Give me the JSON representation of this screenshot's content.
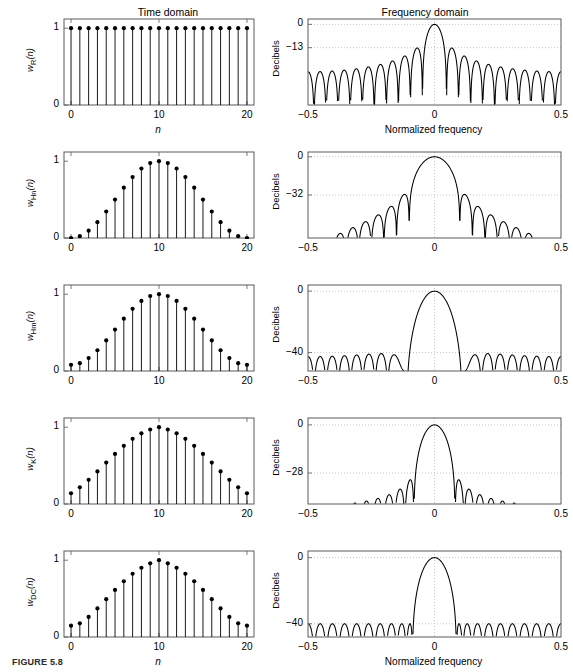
{
  "figure": {
    "caption": "FIGURE 5.8",
    "column_titles": {
      "time": "Time domain",
      "frequency": "Frequency domain"
    },
    "axis_labels": {
      "time_x": "n",
      "freq_x": "Normalized frequency",
      "freq_y": "Decibels"
    }
  },
  "chart_data": [
    {
      "type": "line",
      "panel": "time",
      "row": 1,
      "title": "Time domain",
      "window": "rectangular",
      "ylabel_main": "w",
      "ylabel_sub": "R",
      "ylabel_arg": "(n)",
      "xlabel": "n",
      "x": [
        0,
        1,
        2,
        3,
        4,
        5,
        6,
        7,
        8,
        9,
        10,
        11,
        12,
        13,
        14,
        15,
        16,
        17,
        18,
        19,
        20
      ],
      "values": [
        1,
        1,
        1,
        1,
        1,
        1,
        1,
        1,
        1,
        1,
        1,
        1,
        1,
        1,
        1,
        1,
        1,
        1,
        1,
        1,
        1
      ],
      "xlim": [
        -0.8,
        20.8
      ],
      "ylim": [
        0,
        1.12
      ],
      "xticks": [
        0,
        10,
        20
      ],
      "xticklabels": [
        "0",
        "10",
        "20"
      ],
      "yticks": [
        0,
        1
      ],
      "yticklabels": [
        "0",
        "1"
      ],
      "grid": false,
      "marker": "filled-circle",
      "stem": true
    },
    {
      "type": "line",
      "panel": "frequency",
      "row": 1,
      "title": "Frequency domain",
      "window": "rectangular",
      "ylabel": "Decibels",
      "xlabel": "Normalized frequency",
      "xlim": [
        -0.5,
        0.5
      ],
      "ylim": [
        -45,
        3
      ],
      "xticks": [
        -0.5,
        0,
        0.5
      ],
      "xticklabels": [
        "−0.5",
        "0",
        "0.5"
      ],
      "yticks": [
        0,
        -13
      ],
      "yticklabels": [
        "0",
        "−13"
      ],
      "peak_db": 0,
      "first_sidelobe_db": -13,
      "grid": true,
      "gridstyle": "dotted"
    },
    {
      "type": "line",
      "panel": "time",
      "row": 2,
      "window": "hanning",
      "ylabel_main": "w",
      "ylabel_sub": "Hn",
      "ylabel_arg": "(n)",
      "x": [
        0,
        1,
        2,
        3,
        4,
        5,
        6,
        7,
        8,
        9,
        10,
        11,
        12,
        13,
        14,
        15,
        16,
        17,
        18,
        19,
        20
      ],
      "values": [
        0,
        0.024,
        0.095,
        0.206,
        0.345,
        0.5,
        0.655,
        0.794,
        0.905,
        0.976,
        1,
        0.976,
        0.905,
        0.794,
        0.655,
        0.5,
        0.345,
        0.206,
        0.095,
        0.024,
        0
      ],
      "xlim": [
        -0.8,
        20.8
      ],
      "ylim": [
        0,
        1.12
      ],
      "xticks": [
        0,
        10,
        20
      ],
      "xticklabels": [
        "0",
        "10",
        "20"
      ],
      "yticks": [
        0,
        1
      ],
      "yticklabels": [
        "0",
        "1"
      ],
      "grid": false,
      "marker": "filled-circle",
      "stem": true
    },
    {
      "type": "line",
      "panel": "frequency",
      "row": 2,
      "window": "hanning",
      "ylabel": "Decibels",
      "xlim": [
        -0.5,
        0.5
      ],
      "ylim": [
        -68,
        4
      ],
      "xticks": [
        -0.5,
        0,
        0.5
      ],
      "xticklabels": [
        "−0.5",
        "0",
        "0.5"
      ],
      "yticks": [
        0,
        -32
      ],
      "yticklabels": [
        "0",
        "−32"
      ],
      "peak_db": 0,
      "first_sidelobe_db": -32,
      "grid": true,
      "gridstyle": "dotted"
    },
    {
      "type": "line",
      "panel": "time",
      "row": 3,
      "window": "hamming",
      "ylabel_main": "w",
      "ylabel_sub": "Hm",
      "ylabel_arg": "(n)",
      "x": [
        0,
        1,
        2,
        3,
        4,
        5,
        6,
        7,
        8,
        9,
        10,
        11,
        12,
        13,
        14,
        15,
        16,
        17,
        18,
        19,
        20
      ],
      "values": [
        0.08,
        0.102,
        0.168,
        0.27,
        0.398,
        0.54,
        0.682,
        0.81,
        0.912,
        0.977,
        1,
        0.977,
        0.912,
        0.81,
        0.682,
        0.54,
        0.398,
        0.27,
        0.168,
        0.102,
        0.08
      ],
      "xlim": [
        -0.8,
        20.8
      ],
      "ylim": [
        0,
        1.12
      ],
      "xticks": [
        0,
        10,
        20
      ],
      "xticklabels": [
        "0",
        "10",
        "20"
      ],
      "yticks": [
        0,
        1
      ],
      "yticklabels": [
        "0",
        "1"
      ],
      "grid": false,
      "marker": "filled-circle",
      "stem": true
    },
    {
      "type": "line",
      "panel": "frequency",
      "row": 3,
      "window": "hamming",
      "ylabel": "Decibels",
      "xlim": [
        -0.5,
        0.5
      ],
      "ylim": [
        -52,
        4
      ],
      "xticks": [
        -0.5,
        0,
        0.5
      ],
      "xticklabels": [
        "−0.5",
        "0",
        "0.5"
      ],
      "yticks": [
        0,
        -40
      ],
      "yticklabels": [
        "0",
        "−40"
      ],
      "peak_db": 0,
      "first_sidelobe_db": -40,
      "grid": true,
      "gridstyle": "dotted"
    },
    {
      "type": "line",
      "panel": "time",
      "row": 4,
      "window": "kaiser",
      "ylabel_main": "w",
      "ylabel_sub": "K",
      "ylabel_arg": "(n)",
      "x": [
        0,
        1,
        2,
        3,
        4,
        5,
        6,
        7,
        8,
        9,
        10,
        11,
        12,
        13,
        14,
        15,
        16,
        17,
        18,
        19,
        20
      ],
      "values": [
        0.14,
        0.218,
        0.315,
        0.424,
        0.539,
        0.652,
        0.757,
        0.849,
        0.921,
        0.97,
        1,
        0.97,
        0.921,
        0.849,
        0.757,
        0.652,
        0.539,
        0.424,
        0.315,
        0.218,
        0.14
      ],
      "xlim": [
        -0.8,
        20.8
      ],
      "ylim": [
        0,
        1.12
      ],
      "xticks": [
        0,
        10,
        20
      ],
      "xticklabels": [
        "0",
        "10",
        "20"
      ],
      "yticks": [
        0,
        1
      ],
      "yticklabels": [
        "0",
        "1"
      ],
      "grid": false,
      "marker": "filled-circle",
      "stem": true
    },
    {
      "type": "line",
      "panel": "frequency",
      "row": 4,
      "window": "kaiser",
      "ylabel": "Decibels",
      "xlim": [
        -0.5,
        0.5
      ],
      "ylim": [
        -46,
        4
      ],
      "xticks": [
        -0.5,
        0,
        0.5
      ],
      "xticklabels": [
        "−0.5",
        "0",
        "0.5"
      ],
      "yticks": [
        0,
        -28
      ],
      "yticklabels": [
        "0",
        "−28"
      ],
      "peak_db": 0,
      "first_sidelobe_db": -28,
      "grid": true,
      "gridstyle": "dotted"
    },
    {
      "type": "line",
      "panel": "time",
      "row": 5,
      "window": "dolph-chebyshev",
      "ylabel_main": "w",
      "ylabel_sub": "DC",
      "ylabel_arg": "(n)",
      "xlabel": "n",
      "x": [
        0,
        1,
        2,
        3,
        4,
        5,
        6,
        7,
        8,
        9,
        10,
        11,
        12,
        13,
        14,
        15,
        16,
        17,
        18,
        19,
        20
      ],
      "values": [
        0.148,
        0.178,
        0.262,
        0.372,
        0.492,
        0.613,
        0.726,
        0.824,
        0.902,
        0.96,
        1,
        0.96,
        0.902,
        0.824,
        0.726,
        0.613,
        0.492,
        0.372,
        0.262,
        0.178,
        0.148
      ],
      "xlim": [
        -0.8,
        20.8
      ],
      "ylim": [
        0,
        1.12
      ],
      "xticks": [
        0,
        10,
        20
      ],
      "xticklabels": [
        "0",
        "10",
        "20"
      ],
      "yticks": [
        0,
        1
      ],
      "yticklabels": [
        "0",
        "1"
      ],
      "grid": false,
      "marker": "filled-circle",
      "stem": true
    },
    {
      "type": "line",
      "panel": "frequency",
      "row": 5,
      "window": "dolph-chebyshev",
      "ylabel": "Decibels",
      "xlabel": "Normalized frequency",
      "xlim": [
        -0.5,
        0.5
      ],
      "ylim": [
        -48,
        4
      ],
      "xticks": [
        -0.5,
        0,
        0.5
      ],
      "xticklabels": [
        "−0.5",
        "0",
        "0.5"
      ],
      "yticks": [
        0,
        -40
      ],
      "yticklabels": [
        "0",
        "−40"
      ],
      "peak_db": 0,
      "first_sidelobe_db": -40,
      "equiripple": true,
      "grid": true,
      "gridstyle": "dotted"
    }
  ],
  "style": {
    "line_color": "#000000",
    "axis_color": "#5a5a5a",
    "grid_color": "#b9b9b9",
    "marker_color": "#000000",
    "background": "#ffffff"
  }
}
